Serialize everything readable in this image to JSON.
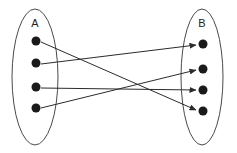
{
  "diagram": {
    "background_color": "#ffffff",
    "sets": [
      {
        "id": "A",
        "label": "A",
        "label_x": 35,
        "label_y": 24,
        "ellipse": {
          "cx": 35,
          "cy": 77,
          "rx": 23,
          "ry": 68
        },
        "stroke_color": "#4a4a4a",
        "elements": [
          {
            "id": "a1",
            "cx": 36,
            "cy": 41,
            "r": 4.5
          },
          {
            "id": "a2",
            "cx": 36,
            "cy": 63,
            "r": 4.5
          },
          {
            "id": "a3",
            "cx": 36,
            "cy": 87,
            "r": 4.5
          },
          {
            "id": "a4",
            "cx": 36,
            "cy": 108,
            "r": 4.5
          }
        ]
      },
      {
        "id": "B",
        "label": "B",
        "label_x": 202,
        "label_y": 24,
        "ellipse": {
          "cx": 202,
          "cy": 77,
          "rx": 21,
          "ry": 68
        },
        "stroke_color": "#4a4a4a",
        "elements": [
          {
            "id": "b1",
            "cx": 203,
            "cy": 44,
            "r": 4.5
          },
          {
            "id": "b2",
            "cx": 203,
            "cy": 69,
            "r": 4.5
          },
          {
            "id": "b3",
            "cx": 203,
            "cy": 90,
            "r": 4.5
          },
          {
            "id": "b4",
            "cx": 203,
            "cy": 111,
            "r": 4.5
          }
        ]
      }
    ],
    "mappings": [
      {
        "id": "a1-b4",
        "from": "a1",
        "to": "b4",
        "x1": 41,
        "y1": 42,
        "x2": 196,
        "y2": 110
      },
      {
        "id": "a2-b1",
        "from": "a2",
        "to": "b1",
        "x1": 41,
        "y1": 64,
        "x2": 196,
        "y2": 45
      },
      {
        "id": "a3-b3",
        "from": "a3",
        "to": "b3",
        "x1": 41,
        "y1": 88,
        "x2": 196,
        "y2": 90
      },
      {
        "id": "a4-b2",
        "from": "a4",
        "to": "b2",
        "x1": 41,
        "y1": 108,
        "x2": 196,
        "y2": 70
      }
    ],
    "arrow_color": "#2b2b2b",
    "dot_color": "#1a1a1a"
  }
}
